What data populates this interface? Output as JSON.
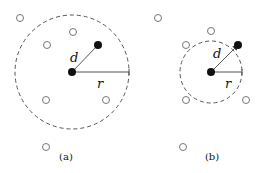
{
  "panels": [
    {
      "caption": "(a)",
      "center": {
        "x": 72,
        "y": 72
      },
      "radius": 57,
      "target": {
        "x": 98,
        "y": 45
      },
      "d_label": "d",
      "r_label": "r",
      "d_label_pos": {
        "x": 70,
        "y": 62
      },
      "r_label_pos": {
        "x": 97,
        "y": 88
      },
      "caption_pos": {
        "x": 66,
        "y": 160
      },
      "open_nodes": [
        {
          "x": 20,
          "y": 18
        },
        {
          "x": 73,
          "y": 32
        },
        {
          "x": 47,
          "y": 45
        },
        {
          "x": 46,
          "y": 100
        },
        {
          "x": 106,
          "y": 100
        },
        {
          "x": 46,
          "y": 147
        }
      ],
      "arrow": false
    },
    {
      "caption": "(b)",
      "center": {
        "x": 211,
        "y": 72
      },
      "radius": 31,
      "target": {
        "x": 238,
        "y": 45
      },
      "d_label": "d",
      "r_label": "r",
      "d_label_pos": {
        "x": 213,
        "y": 58
      },
      "r_label_pos": {
        "x": 225,
        "y": 88
      },
      "caption_pos": {
        "x": 212,
        "y": 160
      },
      "open_nodes": [
        {
          "x": 158,
          "y": 18
        },
        {
          "x": 211,
          "y": 31
        },
        {
          "x": 186,
          "y": 45
        },
        {
          "x": 186,
          "y": 100
        },
        {
          "x": 246,
          "y": 100
        },
        {
          "x": 183,
          "y": 147
        }
      ],
      "arrow": true
    }
  ],
  "style": {
    "stroke": "#555555",
    "dot_fill": "#111111",
    "node_stroke": "#777777"
  }
}
